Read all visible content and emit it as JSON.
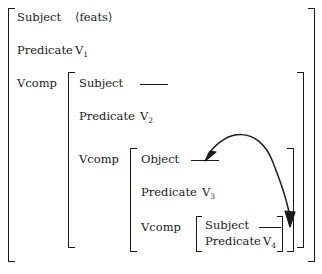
{
  "diagram": {
    "notation": "attribute-value matrix"
  },
  "levels": [
    {
      "id": "level-1",
      "rows": [
        {
          "attribute": "Subject",
          "value_kind": "feats",
          "value": "⟨feats⟩"
        },
        {
          "attribute": "Predicate",
          "value_kind": "var",
          "value": "V",
          "subscript": "1"
        },
        {
          "attribute": "Vcomp",
          "value_kind": "nested",
          "value": ""
        }
      ]
    },
    {
      "id": "level-2",
      "rows": [
        {
          "attribute": "Subject",
          "value_kind": "line",
          "value": ""
        },
        {
          "attribute": "Predicate",
          "value_kind": "var",
          "value": "V",
          "subscript": "2"
        },
        {
          "attribute": "Vcomp",
          "value_kind": "nested",
          "value": ""
        }
      ]
    },
    {
      "id": "level-3",
      "rows": [
        {
          "attribute": "Object",
          "value_kind": "line",
          "value": ""
        },
        {
          "attribute": "Predicate",
          "value_kind": "var",
          "value": "V",
          "subscript": "3"
        },
        {
          "attribute": "Vcomp",
          "value_kind": "nested",
          "value": ""
        }
      ]
    },
    {
      "id": "level-4",
      "rows": [
        {
          "attribute": "Subject",
          "value_kind": "line",
          "value": ""
        },
        {
          "attribute": "Predicate",
          "value_kind": "var",
          "value": "V",
          "subscript": "4"
        }
      ]
    }
  ],
  "labels": {
    "l1_subject": "Subject",
    "l1_feats": "⟨feats⟩",
    "l1_predicate": "Predicate",
    "l1_v": "V",
    "l1_sub": "1",
    "l1_vcomp": "Vcomp",
    "l2_subject": "Subject",
    "l2_predicate": "Predicate",
    "l2_v": "V",
    "l2_sub": "2",
    "l2_vcomp": "Vcomp",
    "l3_object": "Object",
    "l3_predicate": "Predicate",
    "l3_v": "V",
    "l3_sub": "3",
    "l3_vcomp": "Vcomp",
    "l4_subject": "Subject",
    "l4_predicate": "Predicate",
    "l4_v": "V",
    "l4_sub": "4"
  },
  "arc": {
    "name": "control-arc",
    "style": "double-headed curved arrow",
    "from": "object-gap-line",
    "to": "subject-gap-line-innermost",
    "color": "#1a1a1a"
  },
  "colors": {
    "ink": "#1a1a1a",
    "paper": "#ffffff"
  }
}
